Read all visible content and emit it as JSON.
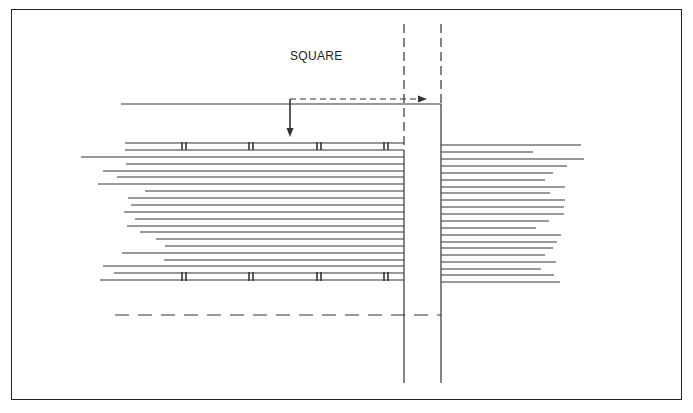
{
  "diagram": {
    "label": "SQUARE",
    "frame": {
      "x": 11,
      "y": 9,
      "w": 671,
      "h": 391
    },
    "colors": {
      "stroke": "#333333",
      "background": "#ffffff"
    },
    "vertical_lines": [
      {
        "id": "left-post-line",
        "x": 404,
        "y1": 24,
        "y2": 383,
        "dashed_top_to": 150
      },
      {
        "id": "right-post-line",
        "x": 441,
        "y1": 24,
        "y2": 383,
        "dashed_top_to": 104
      }
    ],
    "square_reference_line": {
      "x1": 121,
      "x2": 441,
      "y": 104
    },
    "square_arrow_down": {
      "x": 290,
      "y1": 99,
      "y2": 137
    },
    "square_arrow_right": {
      "x1": 290,
      "x2": 418,
      "y": 99
    },
    "bottom_dashed_line": {
      "x1": 115,
      "x2": 441,
      "y": 315
    },
    "left_boards": [
      {
        "y": 143,
        "x1": 125
      },
      {
        "y": 150,
        "x1": 125
      },
      {
        "y": 157,
        "x1": 81
      },
      {
        "y": 164,
        "x1": 126
      },
      {
        "y": 171,
        "x1": 103
      },
      {
        "y": 177,
        "x1": 117
      },
      {
        "y": 184,
        "x1": 98
      },
      {
        "y": 191,
        "x1": 145
      },
      {
        "y": 198,
        "x1": 128
      },
      {
        "y": 205,
        "x1": 131
      },
      {
        "y": 212,
        "x1": 124
      },
      {
        "y": 219,
        "x1": 135
      },
      {
        "y": 226,
        "x1": 127
      },
      {
        "y": 232,
        "x1": 140
      },
      {
        "y": 239,
        "x1": 156
      },
      {
        "y": 246,
        "x1": 165
      },
      {
        "y": 253,
        "x1": 122
      },
      {
        "y": 260,
        "x1": 164
      },
      {
        "y": 266,
        "x1": 103
      },
      {
        "y": 273,
        "x1": 114
      },
      {
        "y": 280,
        "x1": 100
      }
    ],
    "right_boards": [
      {
        "y": 145,
        "x2": 581
      },
      {
        "y": 152,
        "x2": 533
      },
      {
        "y": 159,
        "x2": 584
      },
      {
        "y": 166,
        "x2": 567
      },
      {
        "y": 173,
        "x2": 553
      },
      {
        "y": 180,
        "x2": 545
      },
      {
        "y": 187,
        "x2": 565
      },
      {
        "y": 193,
        "x2": 550
      },
      {
        "y": 200,
        "x2": 565
      },
      {
        "y": 207,
        "x2": 564
      },
      {
        "y": 214,
        "x2": 564
      },
      {
        "y": 221,
        "x2": 549
      },
      {
        "y": 228,
        "x2": 536
      },
      {
        "y": 235,
        "x2": 561
      },
      {
        "y": 242,
        "x2": 557
      },
      {
        "y": 248,
        "x2": 553
      },
      {
        "y": 255,
        "x2": 545
      },
      {
        "y": 262,
        "x2": 556
      },
      {
        "y": 269,
        "x2": 541
      },
      {
        "y": 275,
        "x2": 554
      },
      {
        "y": 282,
        "x2": 560
      }
    ],
    "fastener_marks": {
      "xs": [
        182,
        249,
        317,
        384
      ],
      "rows": [
        {
          "y1": 142,
          "y2": 150
        },
        {
          "y1": 272,
          "y2": 281
        }
      ]
    }
  }
}
